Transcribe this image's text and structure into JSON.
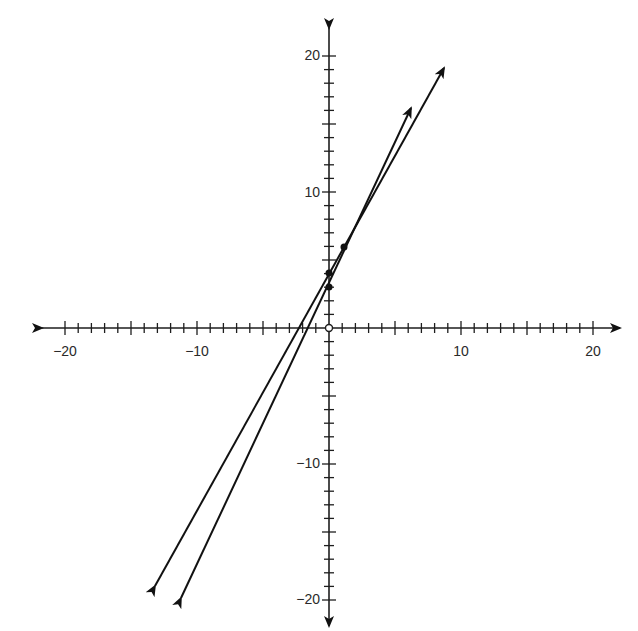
{
  "chart_data": {
    "type": "line",
    "title": "",
    "xlabel": "",
    "ylabel": "",
    "xlim": [
      -20,
      20
    ],
    "ylim": [
      -20,
      20
    ],
    "grid": false,
    "legend": null,
    "x_tick_labels": [
      "-20",
      "-10",
      "10",
      "20"
    ],
    "y_tick_labels": [
      "20",
      "10",
      "-10",
      "-20"
    ],
    "minor_tick_step": 1,
    "major_tick_step": 5,
    "series": [
      {
        "name": "Line A",
        "equation": "y = 2x + 4",
        "marked_points": [
          [
            0,
            4
          ],
          [
            1,
            6
          ]
        ],
        "arrow_ends": [
          [
            8.7,
            19.1
          ],
          [
            -13.2,
            -19.0
          ]
        ]
      },
      {
        "name": "Line B",
        "equation": "y = 3x + 3",
        "marked_points": [
          [
            0,
            3
          ],
          [
            1,
            6
          ]
        ],
        "arrow_ends": [
          [
            6.2,
            16.2
          ],
          [
            -11.2,
            -19.9
          ]
        ]
      }
    ],
    "annotations": [
      {
        "type": "open-circle",
        "at": [
          0,
          0
        ]
      }
    ]
  },
  "axes": {
    "x_labels": {
      "neg20": "−20",
      "neg10": "−10",
      "pos10": "10",
      "pos20": "20"
    },
    "y_labels": {
      "pos20": "20",
      "pos10": "10",
      "neg10": "−10",
      "neg20": "−20"
    }
  },
  "colors": {
    "axis": "#1e1e1e",
    "line": "#111111",
    "background": "#ffffff"
  }
}
